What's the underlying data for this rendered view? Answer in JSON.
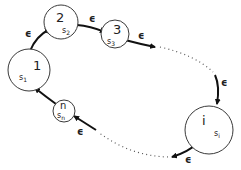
{
  "diagram": {
    "type": "state-cycle",
    "colors": {
      "stroke": "#3a3a3a",
      "arrow": "#111111",
      "dots": "#555555",
      "background": "#ffffff"
    },
    "nodes": [
      {
        "id": "1",
        "label": "1",
        "sub": "s",
        "sub_index": "1"
      },
      {
        "id": "2",
        "label": "2",
        "sub": "s",
        "sub_index": "2"
      },
      {
        "id": "3",
        "label": "3",
        "sub": "s",
        "sub_index": "3"
      },
      {
        "id": "i",
        "label": "i",
        "sub": "s",
        "sub_index": "i"
      },
      {
        "id": "n",
        "label": "n",
        "sub": "s",
        "sub_index": "n"
      }
    ],
    "edges": [
      {
        "from": "1",
        "to": "2",
        "label": "ϵ"
      },
      {
        "from": "2",
        "to": "3",
        "label": "ϵ"
      },
      {
        "from": "3",
        "to": "...",
        "label": "ϵ"
      },
      {
        "from": "...",
        "to": "i",
        "label": "ϵ"
      },
      {
        "from": "i",
        "to": "...",
        "label": "ϵ"
      },
      {
        "from": "...",
        "to": "n",
        "label": "ϵ"
      },
      {
        "from": "n",
        "to": "1",
        "label": ""
      }
    ]
  }
}
